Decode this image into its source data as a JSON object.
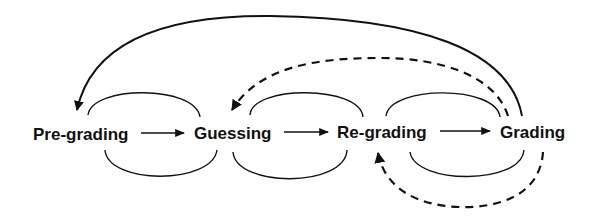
{
  "diagram": {
    "type": "state-flow",
    "nodes": [
      {
        "id": "pre-grading",
        "label": "Pre-grading"
      },
      {
        "id": "guessing",
        "label": "Guessing"
      },
      {
        "id": "re-grading",
        "label": "Re-grading"
      },
      {
        "id": "grading",
        "label": "Grading"
      }
    ],
    "edges": [
      {
        "from": "pre-grading",
        "to": "guessing",
        "style": "solid",
        "kind": "forward"
      },
      {
        "from": "guessing",
        "to": "re-grading",
        "style": "solid",
        "kind": "forward"
      },
      {
        "from": "re-grading",
        "to": "grading",
        "style": "solid",
        "kind": "forward"
      },
      {
        "from": "grading",
        "to": "pre-grading",
        "style": "solid",
        "kind": "return-arc-top"
      },
      {
        "from": "grading",
        "to": "guessing",
        "style": "dashed",
        "kind": "return-arc-top"
      },
      {
        "from": "grading",
        "to": "re-grading",
        "style": "dashed",
        "kind": "return-arc-bottom"
      }
    ],
    "self_loops": [
      "pre-grading-guessing-cycle",
      "guessing-re-grading-cycle",
      "re-grading-grading-cycle"
    ],
    "colors": {
      "stroke": "#111111",
      "background": "#ffffff"
    }
  }
}
